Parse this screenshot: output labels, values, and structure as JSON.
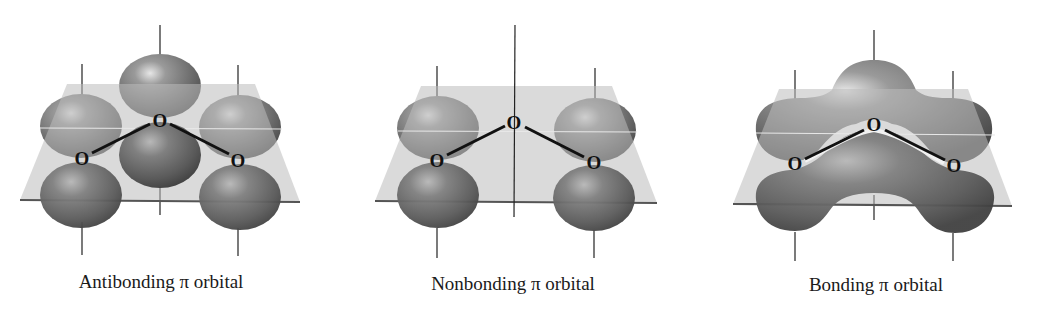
{
  "figure": {
    "panels": [
      {
        "id": "antibonding",
        "label": "Antibonding π orbital",
        "atoms": [
          "O",
          "O",
          "O"
        ]
      },
      {
        "id": "nonbonding",
        "label": "Nonbonding π orbital",
        "atoms": [
          "O",
          "O",
          "O"
        ]
      },
      {
        "id": "bonding",
        "label": "Bonding π orbital",
        "atoms": [
          "O",
          "O",
          "O"
        ]
      }
    ],
    "colors": {
      "lobe_light": "#bdbdbd",
      "lobe_dark": "#4a4a4a",
      "plane": "#bcbcbc",
      "plane_edge": "#555555",
      "bond": "#111111"
    }
  }
}
